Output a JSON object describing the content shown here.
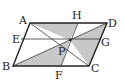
{
  "diagram": {
    "type": "geometry-parallelogram",
    "colors": {
      "shade": "#c8c8c8",
      "stroke": "#222222",
      "background": "#ffffff"
    },
    "points": {
      "A": {
        "label": "A",
        "x": 30,
        "y": 23
      },
      "D": {
        "label": "D",
        "x": 107,
        "y": 23
      },
      "B": {
        "label": "B",
        "x": 13,
        "y": 66
      },
      "C": {
        "label": "C",
        "x": 89,
        "y": 66
      },
      "H": {
        "label": "H",
        "x": 78,
        "y": 23
      },
      "E": {
        "label": "E",
        "x": 21,
        "y": 39
      },
      "G": {
        "label": "G",
        "x": 100,
        "y": 39
      },
      "F": {
        "label": "F",
        "x": 61,
        "y": 66
      },
      "P": {
        "label": "P",
        "x": 70,
        "y": 40
      }
    },
    "segments": [
      "AD",
      "DC",
      "CB",
      "BA",
      "EG",
      "HF",
      "AC",
      "BD"
    ],
    "shaded_triangles": [
      "AHP",
      "BFP",
      "PDC"
    ]
  }
}
